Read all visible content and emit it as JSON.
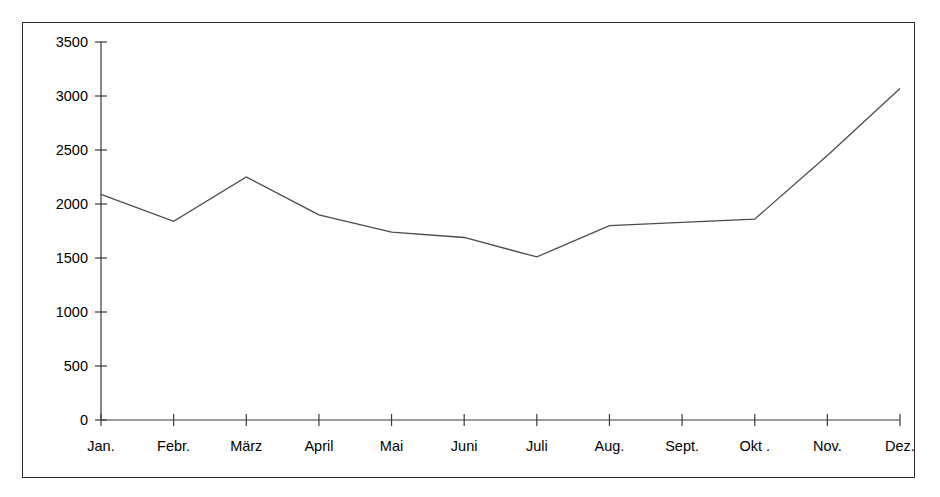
{
  "chart_data": {
    "type": "line",
    "title": "",
    "subtitle": "",
    "xlabel": "",
    "ylabel": "",
    "categories": [
      "Jan.",
      "Febr.",
      "März",
      "April",
      "Mai",
      "Juni",
      "Juli",
      "Aug.",
      "Sept.",
      "Okt .",
      "Nov.",
      "Dez."
    ],
    "values": [
      2090,
      1840,
      2250,
      1900,
      1740,
      1690,
      1510,
      1800,
      1830,
      1860,
      2450,
      3070
    ],
    "series": [
      {
        "name": "",
        "values": [
          2090,
          1840,
          2250,
          1900,
          1740,
          1690,
          1510,
          1800,
          1830,
          1860,
          2450,
          3070
        ]
      }
    ],
    "ylim": [
      0,
      3500
    ],
    "ytick_labels": [
      "0",
      "500",
      "1000",
      "1500",
      "2000",
      "2500",
      "3000",
      "3500"
    ],
    "ytick_values": [
      0,
      500,
      1000,
      1500,
      2000,
      2500,
      3000,
      3500
    ],
    "grid": false,
    "legend": false,
    "legend_position": "none",
    "line_color": "#4a4a4a",
    "axis_color": "#3a3a3a",
    "background_color": "#ffffff",
    "border_color": "#2b2b2b",
    "markers": false
  }
}
